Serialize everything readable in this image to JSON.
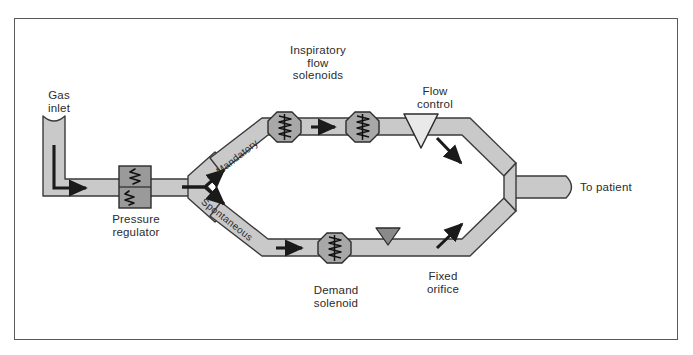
{
  "diagram": {
    "frame": {
      "border_color": "#59595b",
      "background": "#ffffff"
    },
    "colors": {
      "pipe_fill": "#c9c9c9",
      "pipe_outline": "#3a3a3a",
      "component_fill": "#a8a8a8",
      "component_dark": "#8f8f8f",
      "arrow": "#1a1a1a",
      "text": "#2b2b2b"
    },
    "labels": {
      "gas_inlet": "Gas\ninlet",
      "pressure_regulator": "Pressure\nregulator",
      "inspiratory_flow_solenoids": "Inspiratory\nflow\nsolenoids",
      "flow_control": "Flow\ncontrol",
      "to_patient": "To patient",
      "demand_solenoid": "Demand\nsolenoid",
      "fixed_orifice": "Fixed\norifice",
      "mandatory": "Mandatory",
      "spontaneous": "Spontaneous"
    },
    "components": [
      {
        "name": "gas-inlet-port",
        "type": "inlet",
        "branch": "source"
      },
      {
        "name": "pressure-regulator",
        "type": "regulator",
        "branch": "source"
      },
      {
        "name": "flow-splitter",
        "type": "y-junction",
        "branch": "source"
      },
      {
        "name": "inspiratory-flow-solenoid-1",
        "type": "solenoid",
        "branch": "mandatory"
      },
      {
        "name": "inspiratory-flow-solenoid-2",
        "type": "solenoid",
        "branch": "mandatory"
      },
      {
        "name": "flow-control-valve",
        "type": "triangle-valve-open",
        "branch": "mandatory"
      },
      {
        "name": "demand-solenoid",
        "type": "solenoid",
        "branch": "spontaneous"
      },
      {
        "name": "fixed-orifice",
        "type": "triangle-valve-filled",
        "branch": "spontaneous"
      },
      {
        "name": "flow-merger",
        "type": "y-junction",
        "branch": "outlet"
      },
      {
        "name": "patient-outlet-port",
        "type": "outlet",
        "branch": "outlet"
      }
    ],
    "flow_arrows": [
      {
        "name": "inlet-elbow-arrow",
        "branch": "source"
      },
      {
        "name": "mandatory-branch-arrow",
        "branch": "mandatory"
      },
      {
        "name": "spontaneous-branch-arrow",
        "branch": "spontaneous"
      },
      {
        "name": "between-solenoids-arrow",
        "branch": "mandatory"
      },
      {
        "name": "post-flow-control-arrow",
        "branch": "mandatory"
      },
      {
        "name": "pre-demand-solenoid-arrow",
        "branch": "spontaneous"
      },
      {
        "name": "post-fixed-orifice-arrow",
        "branch": "spontaneous"
      }
    ],
    "caption": ""
  }
}
